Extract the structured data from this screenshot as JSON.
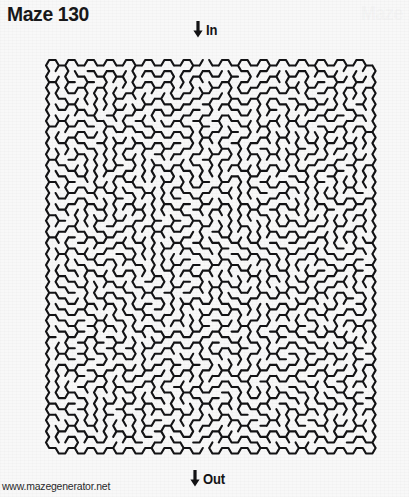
{
  "document": {
    "title": "Maze 130",
    "corner_watermark": "Maze",
    "background_color": "#f8f8f8",
    "ink_color": "#131315"
  },
  "maze": {
    "name": "Maze 130",
    "number": 130,
    "cell_shape": "hexagon",
    "orientation": "flat-top",
    "columns": 34,
    "rows": 35,
    "cell_radius_px": 6.4,
    "wall_thickness_px": 2.1,
    "entrance": {
      "label": "In",
      "arrow_icon": "down-arrow-icon",
      "side": "top",
      "column_index": 16
    },
    "exit": {
      "label": "Out",
      "arrow_icon": "down-arrow-icon",
      "side": "bottom",
      "column_index": 16
    },
    "bounds": {
      "left": 6,
      "top": 44,
      "right": 402,
      "bottom": 462
    }
  },
  "footer": {
    "url": "www.mazegenerator.net"
  }
}
